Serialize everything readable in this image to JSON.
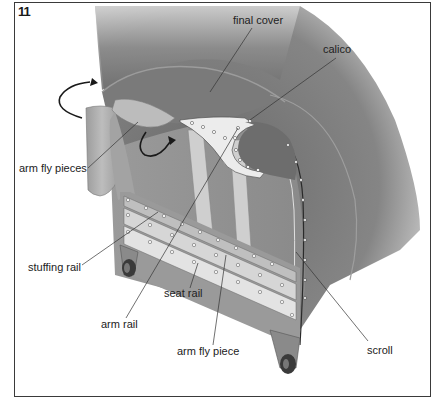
{
  "figure": {
    "number": "11"
  },
  "labels": {
    "final_cover": "final cover",
    "calico": "calico",
    "arm_fly_pieces": "arm fly pieces",
    "stuffing_rail": "stuffing rail",
    "seat_rail": "seat rail",
    "arm_rail": "arm rail",
    "arm_fly_piece": "arm fly piece",
    "scroll": "scroll"
  },
  "icons": {
    "rotate_arrow_outer": "curved-arrow-clockwise",
    "rotate_arrow_inner": "curved-arrow-under"
  },
  "colors": {
    "frame": "#3a3a3a",
    "cover_dark": "#6f6f6f",
    "cover_mid": "#8a8a8a",
    "cover_light": "#b5b5b5",
    "calico": "#ececec",
    "rail": "#d8d8d8",
    "leader": "#333333"
  }
}
